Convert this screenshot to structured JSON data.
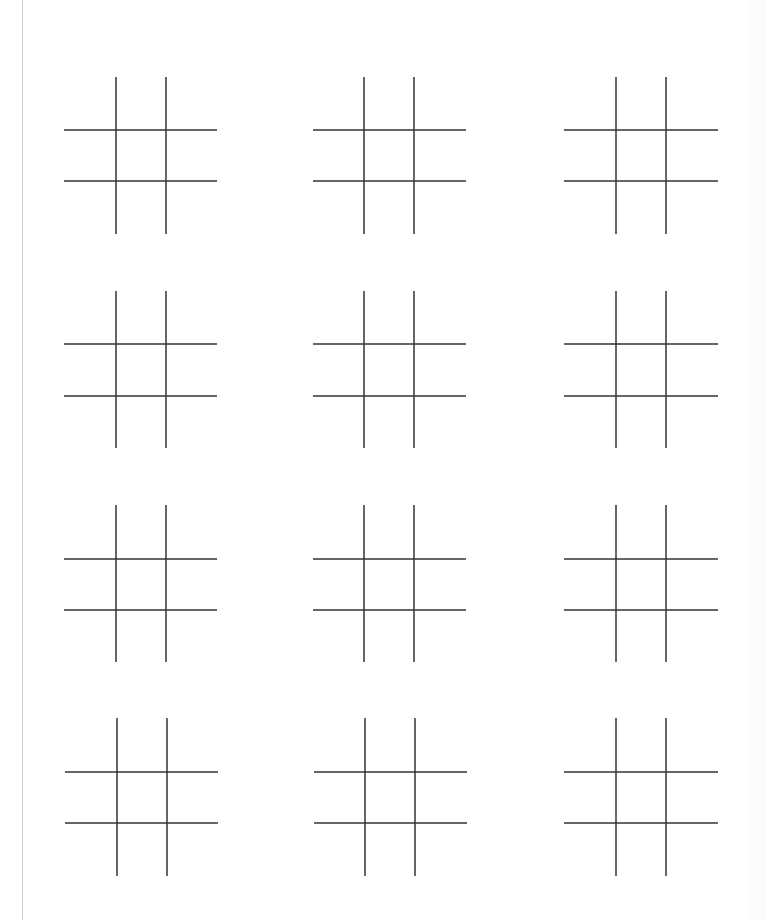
{
  "document": {
    "type": "printable-worksheet",
    "subject": "blank tic-tac-toe boards"
  },
  "layout": {
    "rows": 4,
    "columns": 3,
    "board_count": 12
  },
  "style": {
    "line_color": "#333333",
    "page_border_color": "#cfcfcf",
    "background": "#ffffff"
  },
  "boards": [
    {
      "row": 1,
      "col": 1,
      "cells": [
        "",
        "",
        "",
        "",
        "",
        "",
        "",
        "",
        ""
      ]
    },
    {
      "row": 1,
      "col": 2,
      "cells": [
        "",
        "",
        "",
        "",
        "",
        "",
        "",
        "",
        ""
      ]
    },
    {
      "row": 1,
      "col": 3,
      "cells": [
        "",
        "",
        "",
        "",
        "",
        "",
        "",
        "",
        ""
      ]
    },
    {
      "row": 2,
      "col": 1,
      "cells": [
        "",
        "",
        "",
        "",
        "",
        "",
        "",
        "",
        ""
      ]
    },
    {
      "row": 2,
      "col": 2,
      "cells": [
        "",
        "",
        "",
        "",
        "",
        "",
        "",
        "",
        ""
      ]
    },
    {
      "row": 2,
      "col": 3,
      "cells": [
        "",
        "",
        "",
        "",
        "",
        "",
        "",
        "",
        ""
      ]
    },
    {
      "row": 3,
      "col": 1,
      "cells": [
        "",
        "",
        "",
        "",
        "",
        "",
        "",
        "",
        ""
      ]
    },
    {
      "row": 3,
      "col": 2,
      "cells": [
        "",
        "",
        "",
        "",
        "",
        "",
        "",
        "",
        ""
      ]
    },
    {
      "row": 3,
      "col": 3,
      "cells": [
        "",
        "",
        "",
        "",
        "",
        "",
        "",
        "",
        ""
      ]
    },
    {
      "row": 4,
      "col": 1,
      "cells": [
        "",
        "",
        "",
        "",
        "",
        "",
        "",
        "",
        ""
      ]
    },
    {
      "row": 4,
      "col": 2,
      "cells": [
        "",
        "",
        "",
        "",
        "",
        "",
        "",
        "",
        ""
      ]
    },
    {
      "row": 4,
      "col": 3,
      "cells": [
        "",
        "",
        "",
        "",
        "",
        "",
        "",
        "",
        ""
      ]
    }
  ]
}
